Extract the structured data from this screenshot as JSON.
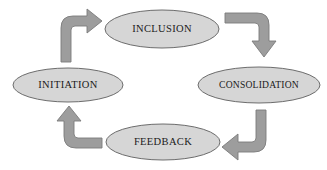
{
  "diagram": {
    "background_color": "#ffffff",
    "node_fill_color": "#d6d6d6",
    "node_stroke_color": "#6d6d6d",
    "arrow_fill_color": "#9d9d9d",
    "arrow_stroke_color": "#7b7b7b",
    "label_color": "#1a1a1a",
    "direction": "clockwise",
    "nodes": [
      {
        "id": "inclusion",
        "label": "INCLUSION",
        "position": "top",
        "cx": 162,
        "cy": 29,
        "rx": 57,
        "ry": 19
      },
      {
        "id": "consolidation",
        "label": "CONSOLIDATION",
        "position": "right",
        "cx": 259,
        "cy": 85,
        "rx": 61,
        "ry": 18
      },
      {
        "id": "feedback",
        "label": "FEEDBACK",
        "position": "bottom",
        "cx": 163,
        "cy": 142,
        "rx": 57,
        "ry": 18
      },
      {
        "id": "initiation",
        "label": "INITIATION",
        "position": "left",
        "cx": 68,
        "cy": 85,
        "rx": 55,
        "ry": 17
      }
    ],
    "arrows": [
      {
        "id": "initiation-to-inclusion",
        "name": "arrow-initiation-to-inclusion",
        "from": "initiation",
        "to": "inclusion",
        "corner": "top-left",
        "points_toward": "right"
      },
      {
        "id": "inclusion-to-consolidation",
        "name": "arrow-inclusion-to-consolidation",
        "from": "inclusion",
        "to": "consolidation",
        "corner": "top-right",
        "points_toward": "down"
      },
      {
        "id": "consolidation-to-feedback",
        "name": "arrow-consolidation-to-feedback",
        "from": "consolidation",
        "to": "feedback",
        "corner": "bottom-right",
        "points_toward": "left"
      },
      {
        "id": "feedback-to-initiation",
        "name": "arrow-feedback-to-initiation",
        "from": "feedback",
        "to": "initiation",
        "corner": "bottom-left",
        "points_toward": "up"
      }
    ]
  }
}
